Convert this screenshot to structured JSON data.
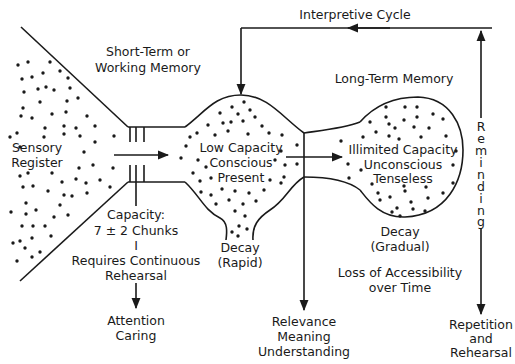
{
  "diagram": {
    "title": "Interpretive Cycle",
    "colors": {
      "ink": "#1a1a1a",
      "background": "#ffffff"
    },
    "labels": {
      "sensory_register": [
        "Sensory",
        "Register"
      ],
      "short_term": [
        "Short-Term or",
        "Working Memory"
      ],
      "short_term_props": [
        "Low Capacity",
        "Conscious",
        "Present"
      ],
      "capacity": [
        "Capacity:",
        "7 ± 2 Chunks",
        "I",
        "Requires Continuous",
        "Rehearsal"
      ],
      "attention": [
        "Attention",
        "Caring"
      ],
      "decay_rapid": [
        "Decay",
        "(Rapid)"
      ],
      "long_term": "Long-Term Memory",
      "long_term_props": [
        "Illimited Capacity",
        "Unconscious",
        "Tenseless"
      ],
      "decay_gradual": [
        "Decay",
        "(Gradual)"
      ],
      "loss": [
        "Loss of Accessibility",
        "over Time"
      ],
      "relevance": [
        "Relevance",
        "Meaning",
        "Understanding"
      ],
      "reminding": [
        "R",
        "e",
        "m",
        "i",
        "n",
        "d",
        "i",
        "n",
        "g"
      ],
      "repetition": [
        "Repetition",
        "and",
        "Rehearsal"
      ]
    }
  }
}
